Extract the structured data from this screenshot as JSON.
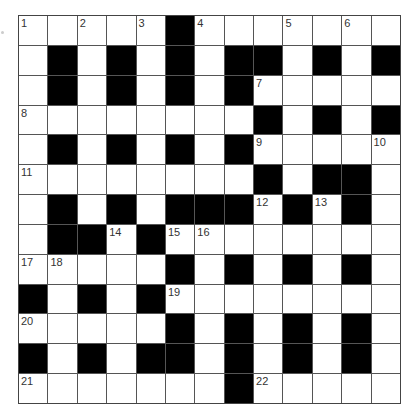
{
  "puzzle": {
    "type": "crossword",
    "size": {
      "rows": 13,
      "cols": 13
    },
    "colors": {
      "block": "#000000",
      "cell": "#ffffff",
      "line": "#555555",
      "number": "#333333"
    },
    "grid": [
      [
        "1",
        ".",
        "2",
        ".",
        "3",
        "#",
        "4",
        ".",
        ".",
        "5",
        ".",
        "6",
        "."
      ],
      [
        ".",
        "#",
        ".",
        "#",
        ".",
        "#",
        ".",
        "#",
        "#",
        ".",
        "#",
        ".",
        "#"
      ],
      [
        ".",
        "#",
        ".",
        "#",
        ".",
        "#",
        ".",
        "#",
        "7",
        ".",
        ".",
        ".",
        "."
      ],
      [
        "8",
        ".",
        ".",
        ".",
        ".",
        ".",
        ".",
        ".",
        "#",
        ".",
        "#",
        ".",
        "#"
      ],
      [
        ".",
        "#",
        ".",
        "#",
        ".",
        "#",
        ".",
        "#",
        "9",
        ".",
        ".",
        ".",
        "10"
      ],
      [
        "11",
        ".",
        ".",
        ".",
        ".",
        ".",
        ".",
        ".",
        "#",
        ".",
        "#",
        "#",
        "."
      ],
      [
        ".",
        "#",
        ".",
        "#",
        ".",
        "#",
        "#",
        "#",
        "12",
        "#",
        "13",
        "#",
        "."
      ],
      [
        ".",
        "#",
        "#",
        "14",
        "#",
        "15",
        "16",
        ".",
        ".",
        ".",
        ".",
        ".",
        "."
      ],
      [
        "17",
        "18",
        ".",
        ".",
        ".",
        "#",
        ".",
        "#",
        ".",
        "#",
        ".",
        "#",
        "."
      ],
      [
        "#",
        ".",
        "#",
        ".",
        "#",
        "19",
        ".",
        ".",
        ".",
        ".",
        ".",
        ".",
        "."
      ],
      [
        "20",
        ".",
        ".",
        ".",
        ".",
        "#",
        ".",
        "#",
        ".",
        "#",
        ".",
        "#",
        "."
      ],
      [
        "#",
        ".",
        "#",
        ".",
        "#",
        "#",
        ".",
        "#",
        ".",
        "#",
        ".",
        "#",
        "."
      ],
      [
        "21",
        ".",
        ".",
        ".",
        ".",
        ".",
        ".",
        "#",
        "22",
        ".",
        ".",
        ".",
        "."
      ]
    ],
    "clue_numbers": [
      "1",
      "2",
      "3",
      "4",
      "5",
      "6",
      "7",
      "8",
      "9",
      "10",
      "11",
      "12",
      "13",
      "14",
      "15",
      "16",
      "17",
      "18",
      "19",
      "20",
      "21",
      "22"
    ]
  }
}
